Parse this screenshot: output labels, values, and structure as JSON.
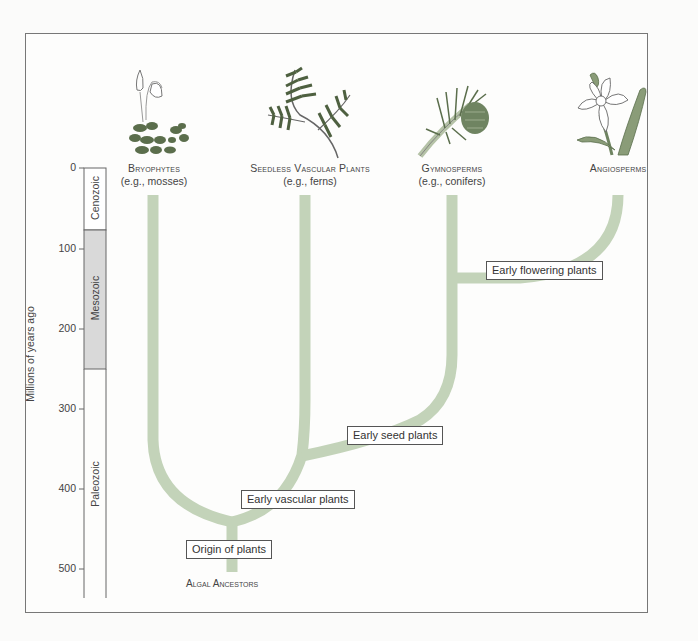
{
  "figure": {
    "axis": {
      "label": "Millions of years ago",
      "ticks": [
        "0",
        "100",
        "200",
        "300",
        "400",
        "500"
      ]
    },
    "eras": [
      {
        "name": "Cenozoic",
        "from": 0,
        "to": 66,
        "fill": "#ffffff"
      },
      {
        "name": "Mesozoic",
        "from": 66,
        "to": 252,
        "fill": "#d9d9d9"
      },
      {
        "name": "Paleozoic",
        "from": 252,
        "to": 541,
        "fill": "#ffffff"
      }
    ],
    "taxa": [
      {
        "name": "Bryophytes",
        "example": "(e.g., mosses)",
        "icon": "moss-icon"
      },
      {
        "name": "Seedless Vascular Plants",
        "example": "(e.g., ferns)",
        "icon": "fern-icon"
      },
      {
        "name": "Gymnosperms",
        "example": "(e.g., conifers)",
        "icon": "conifer-icon"
      },
      {
        "name": "Angiosperms",
        "example": "",
        "icon": "daffodil-icon"
      }
    ],
    "events": [
      {
        "label": "Origin of plants",
        "mya": 475
      },
      {
        "label": "Early vascular plants",
        "mya": 425
      },
      {
        "label": "Early seed plants",
        "mya": 360
      },
      {
        "label": "Early flowering plants",
        "mya": 130
      }
    ],
    "root_label": "Algal Ancestors",
    "colors": {
      "branch": "#c3d3b9",
      "mesozoic": "#d9d9d9",
      "leaf_dark": "#5b6e4c",
      "leaf_light": "#9bae8a",
      "frame": "#777777"
    }
  }
}
